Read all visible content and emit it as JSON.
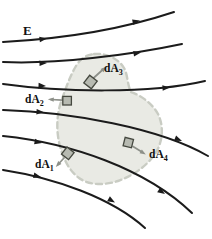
{
  "figure": {
    "type": "physics-field-diagram"
  },
  "labels": {
    "field_vector": "E",
    "area_elements": [
      {
        "id": "dA1",
        "prefix": "d",
        "symbol": "A",
        "subscript": "1"
      },
      {
        "id": "dA2",
        "prefix": "d",
        "symbol": "A",
        "subscript": "2"
      },
      {
        "id": "dA3",
        "prefix": "d",
        "symbol": "A",
        "subscript": "3"
      },
      {
        "id": "dA4",
        "prefix": "d",
        "symbol": "A",
        "subscript": "4"
      }
    ]
  },
  "counts": {
    "field_lines": 6,
    "area_elements": 4
  },
  "colors": {
    "background": "#ffffff",
    "field_line": "#1b1b1b",
    "surface_fill": "#e9eae4",
    "surface_outline": "#c9ccc3",
    "area_element_fill": "#b7bab1",
    "area_element_outline": "#45483f",
    "normal_arrow": "#8d9089",
    "label_text": "#111111",
    "highlight_star": "#ffffff"
  }
}
